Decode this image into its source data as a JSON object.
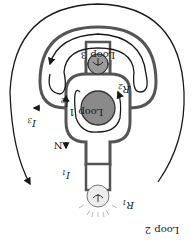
{
  "diagram": {
    "orientation": "rotated 180 degrees",
    "labels": {
      "loop1": "Loop 1",
      "loop2": "Loop 2",
      "loop3": "Loop 3",
      "node": "N",
      "i1": "I",
      "i1_sub": "1",
      "i2": "I",
      "i2_sub": "2",
      "i3": "I",
      "i3_sub": "3",
      "r1": "R",
      "r1_sub": "1",
      "r2": "R",
      "r2_sub": "2"
    },
    "components": [
      {
        "id": "battery",
        "type": "cell",
        "color": "#8a8a8a"
      },
      {
        "id": "bulb-r1",
        "type": "lamp",
        "state": "lit",
        "color": "#e8e8e8"
      },
      {
        "id": "bulb-r2",
        "type": "lamp",
        "state": "unlit",
        "color": "#9a9a9a"
      }
    ],
    "colors": {
      "wire": "#555555",
      "loop_path": "#1a1a1a",
      "battery": "#8a8a8a",
      "background": "#ffffff"
    }
  }
}
